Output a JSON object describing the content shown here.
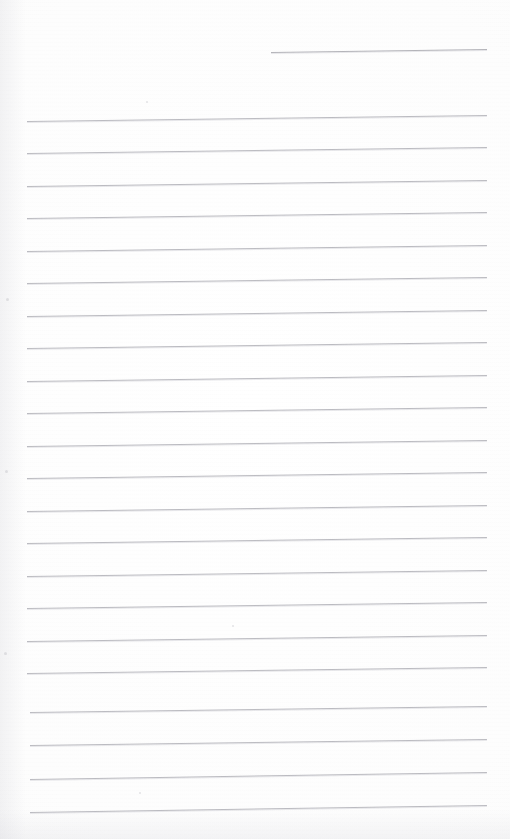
{
  "document": {
    "kind": "scanned-ruled-notepad-page",
    "title": "Blank ruled notepad page (scan)",
    "page_width_px": 510,
    "page_height_px": 839,
    "background_color": "#fdfdfd",
    "rule_color": "#b6b6bc",
    "written_text": "",
    "handwriting_present": "no",
    "visible_text_content": []
  },
  "ruling": {
    "rule_count_total": 23,
    "full_width_rule_count": 22,
    "partial_rule_count": 1,
    "line_spacing_px": 32.5,
    "stroke_width_px": 1,
    "left_margin_px": 27,
    "right_edge_px": 487,
    "skew_degrees": -0.8,
    "orientation": "horizontal",
    "rules": [
      {
        "id": "rule-partial-top",
        "kind": "partial",
        "x_start": 271,
        "x_end": 487,
        "y_left": 52,
        "y_right": 49
      },
      {
        "id": "rule-01",
        "kind": "full",
        "x_start": 27,
        "x_end": 487,
        "y_left": 121,
        "y_right": 115
      },
      {
        "id": "rule-02",
        "kind": "full",
        "x_start": 27,
        "x_end": 487,
        "y_left": 153,
        "y_right": 147
      },
      {
        "id": "rule-03",
        "kind": "full",
        "x_start": 27,
        "x_end": 487,
        "y_left": 186,
        "y_right": 180
      },
      {
        "id": "rule-04",
        "kind": "full",
        "x_start": 27,
        "x_end": 487,
        "y_left": 218,
        "y_right": 212
      },
      {
        "id": "rule-05",
        "kind": "full",
        "x_start": 27,
        "x_end": 487,
        "y_left": 251,
        "y_right": 245
      },
      {
        "id": "rule-06",
        "kind": "full",
        "x_start": 27,
        "x_end": 487,
        "y_left": 283,
        "y_right": 277
      },
      {
        "id": "rule-07",
        "kind": "full",
        "x_start": 27,
        "x_end": 487,
        "y_left": 316,
        "y_right": 310
      },
      {
        "id": "rule-08",
        "kind": "full",
        "x_start": 27,
        "x_end": 487,
        "y_left": 348,
        "y_right": 342
      },
      {
        "id": "rule-09",
        "kind": "full",
        "x_start": 27,
        "x_end": 487,
        "y_left": 381,
        "y_right": 375
      },
      {
        "id": "rule-10",
        "kind": "full",
        "x_start": 27,
        "x_end": 487,
        "y_left": 413,
        "y_right": 407
      },
      {
        "id": "rule-11",
        "kind": "full",
        "x_start": 27,
        "x_end": 487,
        "y_left": 446,
        "y_right": 440
      },
      {
        "id": "rule-12",
        "kind": "full",
        "x_start": 27,
        "x_end": 487,
        "y_left": 478,
        "y_right": 472
      },
      {
        "id": "rule-13",
        "kind": "full",
        "x_start": 27,
        "x_end": 487,
        "y_left": 511,
        "y_right": 505
      },
      {
        "id": "rule-14",
        "kind": "full",
        "x_start": 27,
        "x_end": 487,
        "y_left": 543,
        "y_right": 537
      },
      {
        "id": "rule-15",
        "kind": "full",
        "x_start": 27,
        "x_end": 487,
        "y_left": 576,
        "y_right": 570
      },
      {
        "id": "rule-16",
        "kind": "full",
        "x_start": 27,
        "x_end": 487,
        "y_left": 608,
        "y_right": 602
      },
      {
        "id": "rule-17",
        "kind": "full",
        "x_start": 27,
        "x_end": 487,
        "y_left": 641,
        "y_right": 635
      },
      {
        "id": "rule-18",
        "kind": "full",
        "x_start": 27,
        "x_end": 487,
        "y_left": 673,
        "y_right": 667
      },
      {
        "id": "rule-19",
        "kind": "full",
        "x_start": 30,
        "x_end": 487,
        "y_left": 712,
        "y_right": 706
      },
      {
        "id": "rule-20",
        "kind": "full",
        "x_start": 30,
        "x_end": 487,
        "y_left": 745,
        "y_right": 739
      },
      {
        "id": "rule-21",
        "kind": "full",
        "x_start": 30,
        "x_end": 487,
        "y_left": 779,
        "y_right": 772
      },
      {
        "id": "rule-22",
        "kind": "full",
        "x_start": 30,
        "x_end": 487,
        "y_left": 812,
        "y_right": 805
      }
    ]
  },
  "artifacts": {
    "specks": [
      {
        "x": 146,
        "y": 101,
        "size": 2
      },
      {
        "x": 232,
        "y": 625,
        "size": 2
      },
      {
        "x": 139,
        "y": 792,
        "size": 2
      },
      {
        "x": 6,
        "y": 298,
        "size": 3
      },
      {
        "x": 5,
        "y": 470,
        "size": 3
      },
      {
        "x": 4,
        "y": 652,
        "size": 3
      }
    ]
  }
}
